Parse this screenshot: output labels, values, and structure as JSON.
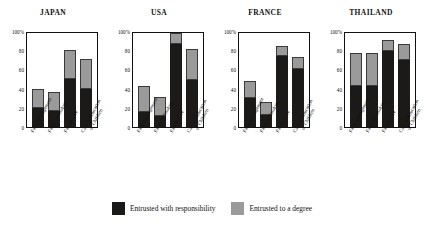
{
  "chart_data": {
    "type": "bar",
    "title": "",
    "subtitle": "",
    "xlabel": "",
    "ylabel": "",
    "ylim": [
      0,
      100
    ],
    "yticks": [
      "100%",
      "80",
      "60",
      "40",
      "20",
      "0"
    ],
    "ytick_values": [
      100,
      80,
      60,
      40,
      20,
      0
    ],
    "grid": false,
    "stacked": true,
    "legend_position": "bottom",
    "legend": [
      {
        "name": "Entrusted with responsibility",
        "color": "#1c1a18"
      },
      {
        "name": "Entrusted to a degree",
        "color": "#9a9a9a"
      }
    ],
    "categories": [
      "Farm Management",
      "Farm Technology",
      "Family Life",
      "Care & Education of Children"
    ],
    "categories_wrapped": [
      {
        "line1": "Farm Management",
        "line2": ""
      },
      {
        "line1": "Farm Technology",
        "line2": ""
      },
      {
        "line1": "Family Life",
        "line2": ""
      },
      {
        "line1": "Care & Education",
        "line2": "of Children"
      }
    ],
    "panels": [
      {
        "title": "JAPAN",
        "series": [
          {
            "name": "Entrusted with responsibility",
            "values": [
              20,
              17,
              50,
              40
            ]
          },
          {
            "name": "Entrusted to a degree",
            "values": [
              20,
              20,
              30,
              31
            ]
          }
        ],
        "totals": [
          40,
          37,
          80,
          71
        ]
      },
      {
        "title": "USA",
        "series": [
          {
            "name": "Entrusted with responsibility",
            "values": [
              16,
              11,
              86,
              49
            ]
          },
          {
            "name": "Entrusted to a degree",
            "values": [
              27,
              20,
              12,
              32
            ]
          }
        ],
        "totals": [
          43,
          31,
          98,
          81
        ]
      },
      {
        "title": "FRANCE",
        "series": [
          {
            "name": "Entrusted with responsibility",
            "values": [
              30,
              13,
              74,
              60
            ]
          },
          {
            "name": "Entrusted to a degree",
            "values": [
              18,
              13,
              10,
              13
            ]
          }
        ],
        "totals": [
          48,
          26,
          84,
          73
        ]
      },
      {
        "title": "THAILAND",
        "series": [
          {
            "name": "Entrusted with responsibility",
            "values": [
              43,
              43,
              79,
              70
            ]
          },
          {
            "name": "Entrusted to a degree",
            "values": [
              34,
              34,
              12,
              17
            ]
          }
        ],
        "totals": [
          77,
          77,
          91,
          87
        ]
      }
    ],
    "colors": {
      "responsibility": "#1c1a18",
      "degree": "#9a9a9a",
      "axis": "#111111",
      "background": "#ffffff"
    }
  }
}
